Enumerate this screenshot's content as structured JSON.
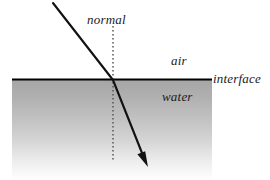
{
  "diagram": {
    "background_color": "#ffffff",
    "ray_color": "#111111",
    "interface_color": "#000000",
    "normal_color": "#4a4a4a",
    "water_top_color": "#a8a8a8",
    "water_bottom_color": "#ffffff",
    "labels": {
      "normal": "normal",
      "air": "air",
      "interface": "interface",
      "water": "water"
    },
    "geometry": {
      "interface_line": {
        "x1": 12,
        "y1": 79,
        "x2": 212,
        "y2": 79
      },
      "normal_line": {
        "x": 113,
        "y1": 26,
        "y2": 160
      },
      "incident_ray": {
        "x1": 53,
        "y1": 3,
        "x2": 113,
        "y2": 80
      },
      "refracted_ray": {
        "x1": 113,
        "y1": 80,
        "x2": 146,
        "y2": 163
      },
      "arrow_tip": {
        "x": 148,
        "y": 167
      },
      "water_region": {
        "x": 12,
        "y": 79,
        "width": 200,
        "height": 101
      }
    }
  }
}
